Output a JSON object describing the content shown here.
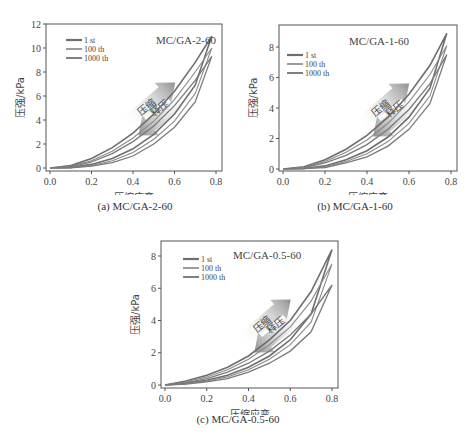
{
  "chart_data": [
    {
      "id": "a",
      "type": "line",
      "title": "MC/GA-2-60",
      "caption": "(a) MC/GA-2-60",
      "xlabel": "压缩应变",
      "ylabel": "压强/kPa",
      "xlim": [
        0.0,
        0.8
      ],
      "ylim": [
        0,
        12
      ],
      "xticks": [
        "0.0",
        "0.2",
        "0.4",
        "0.6",
        "0.8"
      ],
      "yticks": [
        "0",
        "2",
        "4",
        "6",
        "8",
        "10",
        "12"
      ],
      "legend": [
        "1 st",
        "100 th",
        "1000 th"
      ],
      "annotations": [
        "压缩",
        "释压"
      ],
      "series": [
        {
          "name": "1 st",
          "x": [
            0,
            0.1,
            0.2,
            0.3,
            0.4,
            0.5,
            0.6,
            0.7,
            0.78
          ],
          "loading": [
            0,
            0.2,
            0.8,
            1.7,
            2.9,
            4.5,
            6.4,
            8.8,
            11.0
          ],
          "unloading": [
            0,
            0.05,
            0.3,
            0.8,
            1.6,
            2.8,
            4.5,
            6.9,
            11.0
          ]
        },
        {
          "name": "100 th",
          "x": [
            0,
            0.1,
            0.2,
            0.3,
            0.4,
            0.5,
            0.6,
            0.7,
            0.78
          ],
          "loading": [
            0,
            0.15,
            0.6,
            1.4,
            2.5,
            3.9,
            5.7,
            8.0,
            10.0
          ],
          "unloading": [
            0,
            0.03,
            0.2,
            0.6,
            1.3,
            2.4,
            3.9,
            6.2,
            10.0
          ]
        },
        {
          "name": "1000 th",
          "x": [
            0,
            0.1,
            0.2,
            0.3,
            0.4,
            0.5,
            0.6,
            0.7,
            0.78
          ],
          "loading": [
            0,
            0.1,
            0.5,
            1.2,
            2.2,
            3.5,
            5.2,
            7.3,
            9.3
          ],
          "unloading": [
            0,
            0.02,
            0.15,
            0.45,
            1.0,
            2.0,
            3.4,
            5.5,
            9.3
          ]
        }
      ]
    },
    {
      "id": "b",
      "type": "line",
      "title": "MC/GA-1-60",
      "caption": "(b) MC/GA-1-60",
      "xlabel": "压缩应变",
      "ylabel": "压强/kPa",
      "xlim": [
        0.0,
        0.8
      ],
      "ylim": [
        0,
        9
      ],
      "xticks": [
        "0.0",
        "0.2",
        "0.4",
        "0.6",
        "0.8"
      ],
      "yticks": [
        "0",
        "2",
        "4",
        "6",
        "8"
      ],
      "legend": [
        "1 st",
        "100 th",
        "1000 th"
      ],
      "annotations": [
        "压缩",
        "释压"
      ],
      "series": [
        {
          "name": "1 st",
          "x": [
            0,
            0.1,
            0.2,
            0.3,
            0.4,
            0.5,
            0.6,
            0.7,
            0.78
          ],
          "loading": [
            0,
            0.15,
            0.6,
            1.3,
            2.2,
            3.4,
            4.9,
            6.8,
            8.9
          ],
          "unloading": [
            0,
            0.03,
            0.2,
            0.6,
            1.2,
            2.1,
            3.4,
            5.3,
            8.9
          ]
        },
        {
          "name": "100 th",
          "x": [
            0,
            0.1,
            0.2,
            0.3,
            0.4,
            0.5,
            0.6,
            0.7,
            0.78
          ],
          "loading": [
            0,
            0.1,
            0.5,
            1.1,
            1.9,
            3.0,
            4.4,
            6.2,
            8.1
          ],
          "unloading": [
            0,
            0.02,
            0.15,
            0.5,
            1.0,
            1.8,
            3.0,
            4.8,
            8.1
          ]
        },
        {
          "name": "1000 th",
          "x": [
            0,
            0.1,
            0.2,
            0.3,
            0.4,
            0.5,
            0.6,
            0.7,
            0.78
          ],
          "loading": [
            0,
            0.08,
            0.4,
            0.9,
            1.6,
            2.6,
            3.9,
            5.6,
            7.5
          ],
          "unloading": [
            0,
            0.02,
            0.1,
            0.4,
            0.8,
            1.5,
            2.6,
            4.3,
            7.5
          ]
        }
      ]
    },
    {
      "id": "c",
      "type": "line",
      "title": "MC/GA-0.5-60",
      "caption": "(c) MC/GA-0.5-60",
      "xlabel": "压缩应变",
      "ylabel": "压强/kPa",
      "xlim": [
        0.0,
        0.8
      ],
      "ylim": [
        0,
        9
      ],
      "xticks": [
        "0.0",
        "0.2",
        "0.4",
        "0.6",
        "0.8"
      ],
      "yticks": [
        "0",
        "2",
        "4",
        "6",
        "8"
      ],
      "legend": [
        "1 st",
        "100 th",
        "1000 th"
      ],
      "annotations": [
        "压缩",
        "释压"
      ],
      "series": [
        {
          "name": "1 st",
          "x": [
            0,
            0.1,
            0.2,
            0.3,
            0.4,
            0.5,
            0.6,
            0.7,
            0.8
          ],
          "loading": [
            0,
            0.25,
            0.6,
            1.1,
            1.8,
            2.8,
            4.0,
            5.8,
            8.4
          ],
          "unloading": [
            0,
            0.1,
            0.3,
            0.6,
            1.1,
            1.8,
            2.8,
            4.4,
            8.4
          ]
        },
        {
          "name": "100 th",
          "x": [
            0,
            0.1,
            0.2,
            0.3,
            0.4,
            0.5,
            0.6,
            0.7,
            0.8
          ],
          "loading": [
            0,
            0.2,
            0.5,
            0.95,
            1.6,
            2.5,
            3.6,
            5.2,
            7.5
          ],
          "unloading": [
            0,
            0.08,
            0.25,
            0.5,
            0.95,
            1.6,
            2.5,
            3.9,
            7.5
          ]
        },
        {
          "name": "1000 th",
          "x": [
            0,
            0.1,
            0.2,
            0.3,
            0.4,
            0.5,
            0.6,
            0.7,
            0.8
          ],
          "loading": [
            0,
            0.15,
            0.4,
            0.8,
            1.35,
            2.1,
            3.1,
            4.4,
            6.2
          ],
          "unloading": [
            0,
            0.05,
            0.2,
            0.4,
            0.8,
            1.35,
            2.1,
            3.3,
            6.2
          ]
        }
      ]
    }
  ],
  "colors": {
    "line_1st": "#6e6e6e",
    "line_100th": "#8a8a8a",
    "line_1000th": "#7a7a7a",
    "axis": "#555555",
    "arrow": "#8f8f8f"
  }
}
